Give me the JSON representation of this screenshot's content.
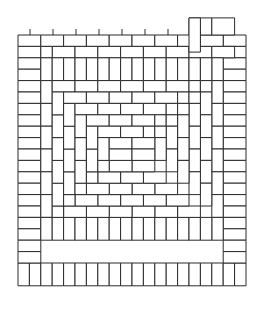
{
  "figure": {
    "kind": "tiling-diagram",
    "caption": "",
    "background_color": "#ffffff",
    "line_color": "#2b2b2b",
    "tile_fill": "#ffffff",
    "stroke_width": 1
  },
  "grid": {
    "unit": 11.4,
    "origin_x": 18,
    "origin_y": 35,
    "cols": 20,
    "rows": 22,
    "brick_long_units": 2,
    "brick_short_units": 1
  },
  "chart_data": {
    "type": "diagram",
    "tile_count": 236,
    "tile_aspect_ratio": "2:1"
  },
  "ticks": {
    "top": [
      30,
      53,
      76,
      99,
      122,
      145,
      168
    ],
    "tick_length": 6,
    "tick_y_start": 29
  }
}
